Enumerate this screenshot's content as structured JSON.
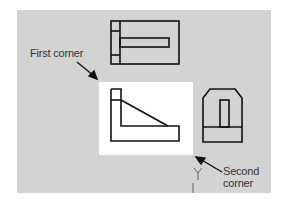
{
  "colors": {
    "background": "#ffffff",
    "panel": "#d3d3d3",
    "selection": "#ffffff",
    "stroke": "#111111",
    "text": "#333333"
  },
  "labels": {
    "first_corner": "First corner",
    "second_corner_line1": "Second",
    "second_corner_line2": "corner"
  },
  "views": [
    {
      "name": "top-view"
    },
    {
      "name": "front-view",
      "selected": true
    },
    {
      "name": "side-view"
    }
  ],
  "cursor": {
    "glyph": "crosshair-y",
    "axis_label": "Y"
  }
}
